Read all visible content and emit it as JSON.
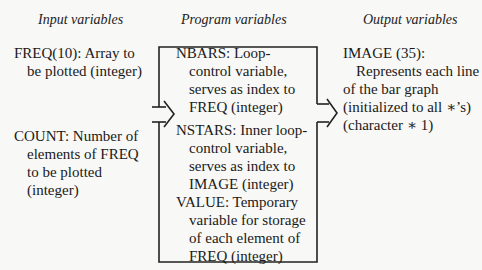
{
  "headers": {
    "input": "Input variables",
    "program": "Program variables",
    "output": "Output variables"
  },
  "input_variables": [
    {
      "lines": [
        "FREQ(10): Array to",
        "be plotted (integer)"
      ]
    },
    {
      "lines": [
        "COUNT: Number of",
        "elements of FREQ",
        "to be plotted",
        "(integer)"
      ]
    }
  ],
  "program_variables": [
    {
      "lines": [
        "NBARS: Loop-",
        "control variable,",
        "serves as index to",
        "FREQ (integer)"
      ]
    },
    {
      "lines": [
        "NSTARS: Inner loop-",
        "control variable,",
        "serves as index to",
        "IMAGE (integer)"
      ]
    },
    {
      "lines": [
        "VALUE: Temporary",
        "variable for storage",
        "of each element of",
        "FREQ (integer)"
      ]
    }
  ],
  "output_variables": [
    {
      "lines": [
        "IMAGE (35):",
        "Represents each line",
        "of the bar graph",
        "(initialized to all ∗’s)",
        "(character ∗ 1)"
      ]
    }
  ],
  "arrows": [
    {
      "name": "input-to-program-arrow",
      "direction": "right"
    },
    {
      "name": "program-to-output-arrow",
      "direction": "right"
    }
  ]
}
